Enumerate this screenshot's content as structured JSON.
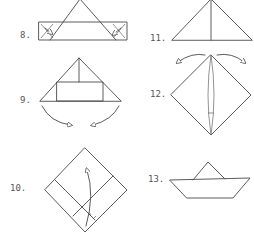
{
  "diagram": {
    "colors": {
      "line": "#4a4a4a",
      "label": "#555555",
      "background": "#ffffff"
    },
    "steps": [
      {
        "number": 8,
        "label": "8.",
        "description": "Fold the corners of the bottom band back behind the triangle"
      },
      {
        "number": 9,
        "label": "9.",
        "description": "Triangle with folded band; pull the bottom corners outward"
      },
      {
        "number": 10,
        "label": "10.",
        "description": "Diamond shape; fold the bottom point up"
      },
      {
        "number": 11,
        "label": "11.",
        "description": "Triangle; pull the two sides apart"
      },
      {
        "number": 12,
        "label": "12.",
        "description": "Diamond shape with center slit"
      },
      {
        "number": 13,
        "label": "13.",
        "description": "Finished paper boat"
      }
    ]
  }
}
